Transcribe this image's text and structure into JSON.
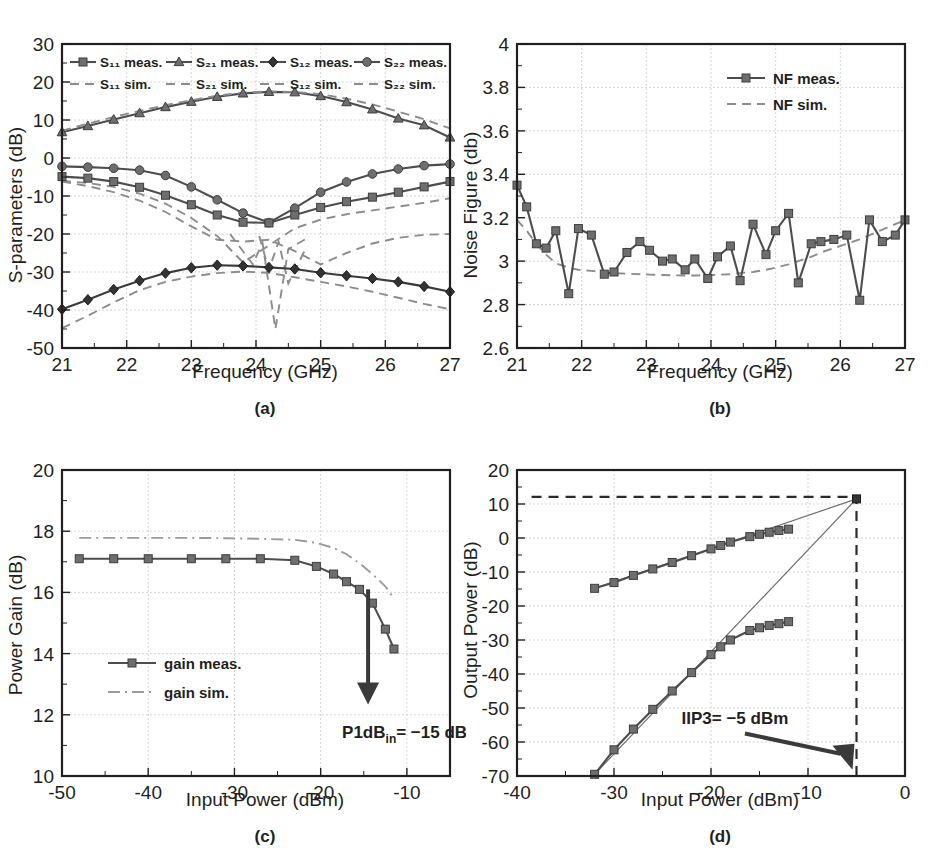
{
  "figure": {
    "panel_tags": [
      "(a)",
      "(b)",
      "(c)",
      "(d)"
    ]
  },
  "chart_data": [
    {
      "id": "s-parameters",
      "type": "line",
      "panel": "(a)",
      "title": "",
      "xlabel": "Frequency (GHz)",
      "ylabel": "S-parameters (dB)",
      "xlim": [
        21,
        27
      ],
      "ylim": [
        -50,
        30
      ],
      "xticks": [
        21,
        22,
        23,
        24,
        25,
        26,
        27
      ],
      "yticks": [
        30,
        20,
        10,
        0,
        -10,
        -20,
        -30,
        -40,
        -50
      ],
      "grid": true,
      "legend_position": "top-inside",
      "legend": [
        {
          "label": "S₁₁ meas.",
          "marker": "square",
          "style": "solid"
        },
        {
          "label": "S₂₁ meas.",
          "marker": "triangle",
          "style": "solid"
        },
        {
          "label": "S₁₂ meas.",
          "marker": "diamond",
          "style": "solid"
        },
        {
          "label": "S₂₂ meas.",
          "marker": "circle",
          "style": "solid"
        },
        {
          "label": "S₁₁ sim.",
          "marker": "none",
          "style": "dashed"
        },
        {
          "label": "S₂₁ sim.",
          "marker": "none",
          "style": "dashed"
        },
        {
          "label": "S₁₂ sim.",
          "marker": "none",
          "style": "dashed"
        },
        {
          "label": "S₂₂ sim.",
          "marker": "none",
          "style": "dashed"
        }
      ],
      "x": [
        21.0,
        21.4,
        21.8,
        22.2,
        22.6,
        23.0,
        23.4,
        23.8,
        24.2,
        24.6,
        25.0,
        25.4,
        25.8,
        26.2,
        26.6,
        27.0
      ],
      "series": [
        {
          "name": "S21 meas.",
          "marker": "triangle",
          "style": "solid",
          "values": [
            6.8,
            8.4,
            10.1,
            11.8,
            13.4,
            14.8,
            16.1,
            17.0,
            17.4,
            17.3,
            16.3,
            14.7,
            12.8,
            10.4,
            8.6,
            5.4
          ]
        },
        {
          "name": "S21 sim.",
          "marker": "none",
          "style": "dashed",
          "values": [
            7.2,
            9.0,
            10.8,
            12.4,
            13.9,
            15.2,
            16.4,
            17.2,
            17.5,
            17.4,
            16.8,
            15.6,
            14.1,
            12.2,
            10.2,
            7.8
          ]
        },
        {
          "name": "S22 meas.",
          "marker": "circle",
          "style": "solid",
          "values": [
            -2.2,
            -2.4,
            -2.7,
            -3.2,
            -4.6,
            -7.6,
            -11.0,
            -14.5,
            -17.0,
            -13.2,
            -9.0,
            -6.3,
            -4.2,
            -2.9,
            -2.0,
            -1.6
          ]
        },
        {
          "name": "S22 sim.",
          "marker": "none",
          "style": "dashed",
          "values": [
            -6.2,
            -7.4,
            -9.0,
            -11.2,
            -14.2,
            -18.0,
            -21.5,
            -22.0,
            -21.5,
            -24.5,
            -28.0,
            -25.0,
            -22.5,
            -21.0,
            -20.2,
            -20.0
          ]
        },
        {
          "name": "S11 meas.",
          "marker": "square",
          "style": "solid",
          "values": [
            -4.9,
            -5.3,
            -6.2,
            -7.7,
            -9.8,
            -12.3,
            -15.0,
            -16.9,
            -17.1,
            -15.0,
            -13.0,
            -11.5,
            -10.3,
            -9.0,
            -7.6,
            -6.2
          ]
        },
        {
          "name": "S11 sim.",
          "marker": "none",
          "style": "dashed",
          "values": [
            -6.0,
            -6.6,
            -7.6,
            -9.4,
            -12.0,
            -15.8,
            -20.5,
            -27.5,
            -23.0,
            -18.5,
            -16.2,
            -14.8,
            -13.8,
            -12.8,
            -11.8,
            -10.6
          ]
        },
        {
          "name": "S12 meas.",
          "marker": "diamond",
          "style": "solid",
          "values": [
            -39.8,
            -37.3,
            -34.6,
            -32.3,
            -30.3,
            -28.9,
            -28.2,
            -28.4,
            -28.8,
            -29.2,
            -30.2,
            -31.0,
            -31.7,
            -32.6,
            -33.8,
            -35.2
          ]
        },
        {
          "name": "S12 sim.",
          "marker": "none",
          "style": "dashed",
          "values": [
            -44.8,
            -41.5,
            -38.0,
            -34.8,
            -32.6,
            -31.2,
            -30.3,
            -29.9,
            -30.2,
            -31.4,
            -32.6,
            -33.8,
            -35.2,
            -36.8,
            -38.4,
            -39.8
          ]
        }
      ],
      "extra_sim_spikes": [
        {
          "name": "S11 sim. notch",
          "points": [
            [
              23.6,
              -20.0
            ],
            [
              23.95,
              -28.0
            ],
            [
              24.1,
              -22.3
            ],
            [
              24.3,
              -45.0
            ],
            [
              24.5,
              -24.0
            ],
            [
              24.8,
              -21.0
            ]
          ]
        },
        {
          "name": "S22 sim. notch",
          "points": [
            [
              24.05,
              -20.5
            ],
            [
              24.2,
              -29.5
            ],
            [
              24.35,
              -22.0
            ],
            [
              24.5,
              -33.0
            ],
            [
              24.75,
              -24.5
            ]
          ]
        }
      ]
    },
    {
      "id": "noise-figure",
      "type": "line",
      "panel": "(b)",
      "title": "",
      "xlabel": "Frequency (GHz)",
      "ylabel": "Noise Figure (db)",
      "xlim": [
        21,
        27
      ],
      "ylim": [
        2.6,
        4.0
      ],
      "xticks": [
        21,
        22,
        23,
        24,
        25,
        26,
        27
      ],
      "yticks": [
        4.0,
        3.8,
        3.6,
        3.4,
        3.2,
        3.0,
        2.8,
        2.6
      ],
      "grid": true,
      "legend_position": "top-right-inside",
      "legend": [
        {
          "label": "NF meas.",
          "marker": "square",
          "style": "solid"
        },
        {
          "label": "NF sim.",
          "marker": "none",
          "style": "dashed"
        }
      ],
      "x": [
        21.0,
        21.15,
        21.3,
        21.45,
        21.6,
        21.8,
        21.95,
        22.15,
        22.35,
        22.5,
        22.7,
        22.9,
        23.05,
        23.25,
        23.4,
        23.6,
        23.75,
        23.95,
        24.1,
        24.3,
        24.45,
        24.65,
        24.85,
        25.0,
        25.2,
        25.35,
        25.55,
        25.7,
        25.9,
        26.1,
        26.3,
        26.45,
        26.65,
        26.85,
        27.0
      ],
      "series": [
        {
          "name": "NF meas.",
          "marker": "square",
          "style": "solid",
          "values": [
            3.35,
            3.25,
            3.08,
            3.06,
            3.14,
            2.85,
            3.15,
            3.12,
            2.94,
            2.95,
            3.04,
            3.09,
            3.05,
            3.0,
            3.01,
            2.96,
            3.01,
            2.92,
            3.02,
            3.07,
            2.91,
            3.17,
            3.03,
            3.14,
            3.22,
            2.9,
            3.08,
            3.09,
            3.1,
            3.12,
            2.82,
            3.19,
            3.09,
            3.12,
            3.19
          ]
        },
        {
          "name": "NF sim.",
          "marker": "none",
          "style": "dashed",
          "values": [
            3.19,
            3.14,
            3.08,
            3.03,
            2.99,
            2.97,
            2.96,
            2.955,
            2.95,
            2.945,
            2.942,
            2.94,
            2.938,
            2.936,
            2.935,
            2.934,
            2.934,
            2.935,
            2.937,
            2.94,
            2.945,
            2.95,
            2.96,
            2.97,
            2.985,
            3.0,
            3.02,
            3.04,
            3.06,
            3.08,
            3.1,
            3.12,
            3.145,
            3.17,
            3.19
          ]
        }
      ]
    },
    {
      "id": "power-gain-compression",
      "type": "line",
      "panel": "(c)",
      "title": "",
      "xlabel": "Input Power (dBm)",
      "ylabel": "Power Gain (dB)",
      "xlim": [
        -50,
        -5
      ],
      "ylim": [
        10,
        20
      ],
      "xticks": [
        -50,
        -40,
        -30,
        -20,
        -10
      ],
      "yticks": [
        20,
        18,
        16,
        14,
        12,
        10
      ],
      "grid": true,
      "legend_position": "lower-left-inside",
      "legend": [
        {
          "label": "gain meas.",
          "marker": "square",
          "style": "solid"
        },
        {
          "label": "gain sim.",
          "marker": "none",
          "style": "dashdot"
        }
      ],
      "annotation": {
        "text_html": "P1dB<sub>in</sub>= −15 dBm",
        "arrow_x": -14.5,
        "arrow_y_from": 16.1,
        "arrow_y_to": 12.6
      },
      "x": [
        -48,
        -44,
        -40,
        -35,
        -31,
        -27,
        -23,
        -20.5,
        -18.5,
        -17,
        -15.5,
        -14,
        -12.5,
        -11.5
      ],
      "series": [
        {
          "name": "gain meas.",
          "marker": "square",
          "style": "solid",
          "values": [
            17.1,
            17.1,
            17.1,
            17.1,
            17.1,
            17.1,
            17.05,
            16.85,
            16.6,
            16.35,
            16.1,
            15.65,
            14.8,
            14.15
          ]
        },
        {
          "name": "gain sim.",
          "marker": "none",
          "style": "dashdot",
          "values": [
            17.78,
            17.78,
            17.78,
            17.78,
            17.77,
            17.75,
            17.72,
            17.62,
            17.45,
            17.25,
            16.95,
            16.6,
            16.2,
            15.8
          ]
        }
      ]
    },
    {
      "id": "iip3-two-tone",
      "type": "line",
      "panel": "(d)",
      "title": "",
      "xlabel": "Input Power (dBm)",
      "ylabel": "Output Power (dB)",
      "xlim": [
        -40,
        0
      ],
      "ylim": [
        -70,
        20
      ],
      "xticks": [
        -40,
        -30,
        -20,
        -10,
        0
      ],
      "yticks": [
        20,
        10,
        0,
        -10,
        -20,
        -30,
        -40,
        -50,
        -60,
        -70
      ],
      "grid": true,
      "legend_position": "none",
      "annotation": {
        "text": "IIP3= −5 dBm",
        "point_x": -5,
        "point_y": 11.5
      },
      "intercept": {
        "x": -5,
        "y": 11.5
      },
      "extrapolation_lines": [
        {
          "name": "fundamental extrapolation",
          "from": [
            -32,
            -14.8
          ],
          "to": [
            -5,
            11.5
          ]
        },
        {
          "name": "im3 extrapolation",
          "from": [
            -32,
            -69.5
          ],
          "to": [
            -5,
            11.5
          ]
        }
      ],
      "reference_lines": [
        {
          "name": "horizontal intercept marker",
          "orientation": "horizontal",
          "value": 12.1,
          "from_x": -38.5,
          "to_x": -5
        },
        {
          "name": "vertical intercept marker",
          "orientation": "vertical",
          "value": -5,
          "from_y": -70,
          "to_y": 11.5
        }
      ],
      "x_fundamental": [
        -32,
        -30,
        -28,
        -26,
        -24,
        -22,
        -20,
        -19,
        -18,
        -16,
        -15,
        -14,
        -13,
        -12
      ],
      "x_im3": [
        -32,
        -30,
        -28,
        -26,
        -24,
        -22,
        -20,
        -19,
        -18,
        -16,
        -15,
        -14,
        -13,
        -12
      ],
      "series": [
        {
          "name": "fundamental tone meas.",
          "marker": "square",
          "style": "solid",
          "values": [
            -14.8,
            -13.1,
            -11.0,
            -9.1,
            -7.2,
            -5.2,
            -3.2,
            -2.2,
            -1.2,
            0.4,
            1.1,
            1.7,
            2.2,
            2.6
          ]
        },
        {
          "name": "IM3 tone meas.",
          "marker": "square",
          "style": "solid",
          "values": [
            -69.5,
            -62.3,
            -56.2,
            -50.4,
            -45.0,
            -39.6,
            -34.3,
            -32.0,
            -30.0,
            -27.2,
            -26.4,
            -25.7,
            -25.2,
            -24.6
          ]
        }
      ]
    }
  ]
}
